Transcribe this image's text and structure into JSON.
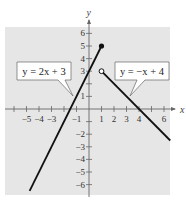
{
  "chart_data": {
    "type": "line",
    "title": "",
    "xlabel": "x",
    "ylabel": "y",
    "xlim": [
      -6.7,
      6.5
    ],
    "ylim": [
      -6.8,
      6.5
    ],
    "grid": false,
    "background": "#e6e6e6",
    "x_ticks": [
      -6,
      -5,
      -4,
      -3,
      -2,
      -1,
      1,
      2,
      3,
      4,
      5,
      6
    ],
    "x_tick_labels": [
      {
        "value": -5,
        "label": "−5"
      },
      {
        "value": -4,
        "label": "−4"
      },
      {
        "value": -3,
        "label": "−3"
      },
      {
        "value": -1,
        "label": "−1"
      },
      {
        "value": 1,
        "label": "1"
      },
      {
        "value": 2,
        "label": "2"
      },
      {
        "value": 3,
        "label": "3"
      },
      {
        "value": 4,
        "label": "4"
      },
      {
        "value": 6,
        "label": "6"
      }
    ],
    "y_tick_labels": [
      {
        "value": 6,
        "label": "6"
      },
      {
        "value": 5,
        "label": "5"
      },
      {
        "value": 4,
        "label": "4"
      },
      {
        "value": 3,
        "label": "3"
      },
      {
        "value": 1,
        "label": "1"
      },
      {
        "value": -2,
        "label": "−2"
      },
      {
        "value": -3,
        "label": "−3"
      },
      {
        "value": -4,
        "label": "−4"
      },
      {
        "value": -5,
        "label": "−5"
      },
      {
        "value": -6,
        "label": "−6"
      }
    ],
    "series": [
      {
        "name": "y = 2x + 3",
        "x": [
          -4.75,
          1
        ],
        "y": [
          -6.5,
          5
        ],
        "endpoint": {
          "x": 1,
          "y": 5,
          "style": "closed"
        }
      },
      {
        "name": "y = −x + 4",
        "x": [
          1,
          6.5
        ],
        "y": [
          3,
          -2.5
        ],
        "endpoint": {
          "x": 1,
          "y": 3,
          "style": "open"
        }
      }
    ],
    "annotations": [
      {
        "text": "y = 2x + 3",
        "points_to_series": 0
      },
      {
        "text": "y = −x + 4",
        "points_to_series": 1
      }
    ]
  },
  "labels": {
    "x_axis": "x",
    "y_axis": "y",
    "eq1": "y = 2x + 3",
    "eq2": "y = −x + 4"
  }
}
